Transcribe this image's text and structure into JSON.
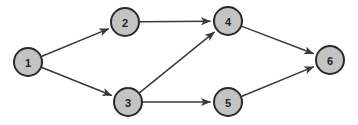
{
  "diagram": {
    "type": "directed-graph",
    "background_color": "#ffffff",
    "node_fill_color": "#c3c3c3",
    "node_stroke_color": "#2a2a2a",
    "node_stroke_width": 2,
    "node_radius": 14,
    "edge_color": "#3a3a3a",
    "edge_stroke_width": 1.5,
    "canvas_width": 358,
    "canvas_height": 125,
    "nodes": [
      {
        "id": "1",
        "label": "1",
        "x": 28,
        "y": 62
      },
      {
        "id": "2",
        "label": "2",
        "x": 125,
        "y": 22
      },
      {
        "id": "3",
        "label": "3",
        "x": 128,
        "y": 102
      },
      {
        "id": "4",
        "label": "4",
        "x": 228,
        "y": 21
      },
      {
        "id": "5",
        "label": "5",
        "x": 228,
        "y": 102
      },
      {
        "id": "6",
        "label": "6",
        "x": 330,
        "y": 60
      }
    ],
    "edges": [
      {
        "from": "1",
        "to": "2"
      },
      {
        "from": "1",
        "to": "3"
      },
      {
        "from": "2",
        "to": "4"
      },
      {
        "from": "3",
        "to": "4"
      },
      {
        "from": "3",
        "to": "5"
      },
      {
        "from": "4",
        "to": "6"
      },
      {
        "from": "5",
        "to": "6"
      }
    ]
  }
}
